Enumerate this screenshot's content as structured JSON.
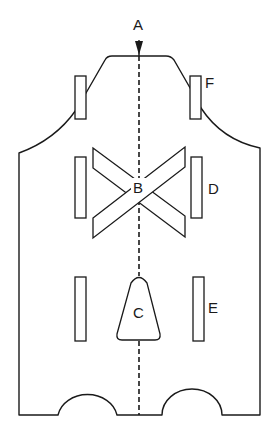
{
  "diagram": {
    "type": "schematic-outline",
    "labels": {
      "A": "A",
      "B": "B",
      "C": "C",
      "D": "D",
      "E": "E",
      "F": "F"
    },
    "colors": {
      "stroke": "#1a1a1a",
      "background": "#ffffff"
    },
    "elements": [
      {
        "id": "A",
        "kind": "arrow-marker",
        "description": "direction indicator at top of center axis"
      },
      {
        "id": "B",
        "kind": "crossed-bars",
        "description": "two crossed rectangular bars at center"
      },
      {
        "id": "C",
        "kind": "trapezoid-block",
        "description": "bell-shaped block on center axis"
      },
      {
        "id": "D",
        "kind": "rect-pair",
        "description": "middle pair of vertical slots"
      },
      {
        "id": "E",
        "kind": "rect-pair",
        "description": "lower pair of vertical slots"
      },
      {
        "id": "F",
        "kind": "rect-pair",
        "description": "upper pair of vertical slots on shoulders"
      }
    ]
  }
}
